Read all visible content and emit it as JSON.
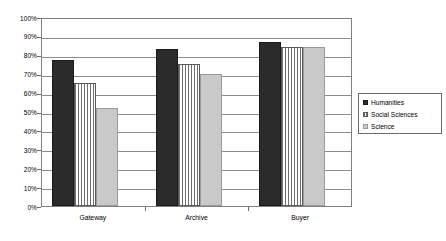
{
  "chart_data": {
    "type": "bar",
    "title": "",
    "xlabel": "",
    "ylabel": "",
    "categories": [
      "Gateway",
      "Archive",
      "Buyer"
    ],
    "series": [
      {
        "name": "Humanities",
        "values": [
          77,
          83,
          87
        ],
        "color": "#2b2b2b",
        "pattern": "solid-dark"
      },
      {
        "name": "Social Sciences",
        "values": [
          65,
          75,
          84
        ],
        "color": "#ffffff",
        "pattern": "vertical-stripes"
      },
      {
        "name": "Science",
        "values": [
          52,
          70,
          84
        ],
        "color": "#c9c9c9",
        "pattern": "solid-light"
      }
    ],
    "ylim": [
      0,
      100
    ],
    "ytick_values": [
      0,
      10,
      20,
      30,
      40,
      50,
      60,
      70,
      80,
      90,
      100
    ],
    "ytick_labels": [
      "0%",
      "10%",
      "20%",
      "30%",
      "40%",
      "50%",
      "60%",
      "70%",
      "80%",
      "90%",
      "100%"
    ],
    "grid": "horizontal",
    "legend_position": "right",
    "value_suffix": "%"
  }
}
